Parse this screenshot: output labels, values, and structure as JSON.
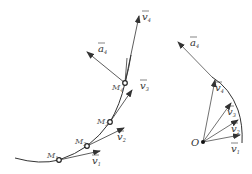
{
  "left_diagram": {
    "curve_label": "trajectory",
    "points": [
      {
        "name": "M",
        "sub": "1"
      },
      {
        "name": "M",
        "sub": "2"
      },
      {
        "name": "M",
        "sub": "3"
      },
      {
        "name": "M",
        "sub": "4"
      }
    ],
    "velocities": [
      {
        "name": "v",
        "sub": "1"
      },
      {
        "name": "v",
        "sub": "2"
      },
      {
        "name": "v",
        "sub": "3"
      },
      {
        "name": "v",
        "sub": "4"
      }
    ],
    "acceleration": {
      "name": "a",
      "sub": "4"
    }
  },
  "right_diagram": {
    "origin": "O",
    "velocities": [
      {
        "name": "v",
        "sub": "1"
      },
      {
        "name": "v",
        "sub": "2"
      },
      {
        "name": "v",
        "sub": "3"
      },
      {
        "name": "v",
        "sub": "4"
      }
    ],
    "acceleration": {
      "name": "a",
      "sub": "4"
    }
  },
  "colors": {
    "line": "#333333",
    "arrow": "#444444"
  }
}
